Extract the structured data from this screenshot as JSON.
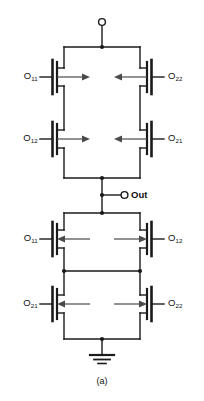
{
  "figure": {
    "caption": "(a)",
    "terminals": {
      "supply_label": "",
      "output_label": "Out",
      "ground_label": ""
    },
    "colors": {
      "wire": "#1a1a1a",
      "device": "#000000",
      "arrow": "#4a4a4a",
      "background": "#ffffff",
      "text": "#111111"
    },
    "upper_block": {
      "name": "pull-up-network",
      "transistors": [
        {
          "id": "p11",
          "base": "O",
          "sub": "11",
          "side": "left",
          "row": 1,
          "arrow": "right"
        },
        {
          "id": "p22",
          "base": "O",
          "sub": "22",
          "side": "right",
          "row": 1,
          "arrow": "left"
        },
        {
          "id": "p12",
          "base": "O",
          "sub": "12",
          "side": "left",
          "row": 2,
          "arrow": "right"
        },
        {
          "id": "p21",
          "base": "O",
          "sub": "21",
          "side": "right",
          "row": 2,
          "arrow": "left"
        }
      ]
    },
    "lower_block": {
      "name": "pull-down-network",
      "transistors": [
        {
          "id": "n11",
          "base": "O",
          "sub": "11",
          "side": "left",
          "row": 3,
          "arrow": "left"
        },
        {
          "id": "n12",
          "base": "O",
          "sub": "12",
          "side": "right",
          "row": 3,
          "arrow": "right"
        },
        {
          "id": "n21",
          "base": "O",
          "sub": "21",
          "side": "left",
          "row": 4,
          "arrow": "left"
        },
        {
          "id": "n22",
          "base": "O",
          "sub": "22",
          "side": "right",
          "row": 4,
          "arrow": "right"
        }
      ]
    },
    "labels": {
      "u_r1_left": {
        "base": "O",
        "sub": "11"
      },
      "u_r1_right": {
        "base": "O",
        "sub": "22"
      },
      "u_r2_left": {
        "base": "O",
        "sub": "12"
      },
      "u_r2_right": {
        "base": "O",
        "sub": "21"
      },
      "l_r3_left": {
        "base": "O",
        "sub": "11"
      },
      "l_r3_right": {
        "base": "O",
        "sub": "12"
      },
      "l_r4_left": {
        "base": "O",
        "sub": "21"
      },
      "l_r4_right": {
        "base": "O",
        "sub": "22"
      }
    }
  }
}
